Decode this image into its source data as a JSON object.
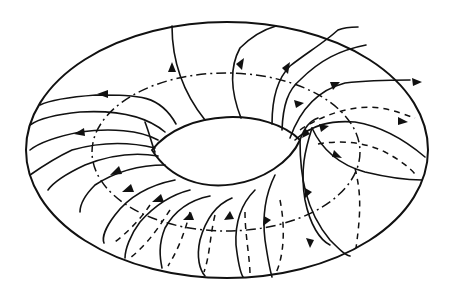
{
  "figure": {
    "colors": {
      "line": "#111111",
      "background": "#ffffff"
    },
    "outer_ellipse": {
      "cx": 227,
      "cy": 150,
      "rx": 201,
      "ry": 128
    },
    "core_circle_dashdot": {
      "cx": 226,
      "cy": 152,
      "rx": 136,
      "ry": 80
    },
    "hole": {
      "left_x": 152,
      "right_x": 300,
      "top_y": 118,
      "bottom_y": 196
    },
    "flow_line_count_solid": 17,
    "hidden_line_count_dashed": 8,
    "arrowhead_count": 20
  }
}
